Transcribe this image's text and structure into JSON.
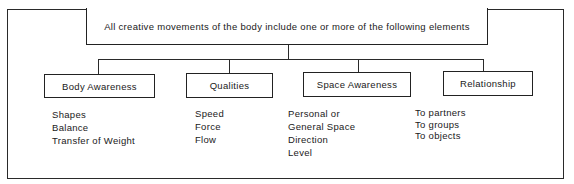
{
  "diagram": {
    "title": "All creative movements of the body include one or more of the following elements",
    "categories": [
      {
        "label": "Body Awareness",
        "items": [
          "Shapes",
          "Balance",
          "Transfer of Weight"
        ]
      },
      {
        "label": "Qualities",
        "items": [
          "Speed",
          "Force",
          "Flow"
        ]
      },
      {
        "label": "Space Awareness",
        "items": [
          "Personal or",
          "General Space",
          "Direction",
          "Level"
        ]
      },
      {
        "label": "Relationship",
        "items": [
          "To partners",
          "To groups",
          "To objects"
        ]
      }
    ]
  }
}
